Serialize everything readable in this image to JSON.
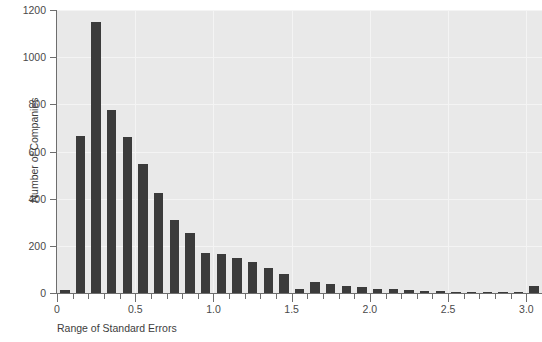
{
  "top_caption": "",
  "chart_data": {
    "type": "bar",
    "title": "",
    "xlabel": "Range of Standard Errors",
    "ylabel": "Number of Companies",
    "xlim": [
      0,
      3.1
    ],
    "ylim": [
      0,
      1200
    ],
    "grid": true,
    "legend": null,
    "bin_width": 0.1,
    "x_tick_labels": [
      "0",
      "0.5",
      "1.0",
      "1.5",
      "2.0",
      "2.5",
      "3.0"
    ],
    "x_tick_values": [
      0,
      0.5,
      1.0,
      1.5,
      2.0,
      2.5,
      3.0
    ],
    "x_minor_tick_step": 0.1,
    "y_tick_labels": [
      "0",
      "200",
      "400",
      "600",
      "800",
      "1000",
      "1200"
    ],
    "y_tick_values": [
      0,
      200,
      400,
      600,
      800,
      1000,
      1200
    ],
    "bar_color": "#3b3b3b",
    "plot_background": "#e9e9e9",
    "x": [
      0.05,
      0.15,
      0.25,
      0.35,
      0.45,
      0.55,
      0.65,
      0.75,
      0.85,
      0.95,
      1.05,
      1.15,
      1.25,
      1.35,
      1.45,
      1.55,
      1.65,
      1.75,
      1.85,
      1.95,
      2.05,
      2.15,
      2.25,
      2.35,
      2.45,
      2.55,
      2.65,
      2.75,
      2.85,
      2.95,
      3.05
    ],
    "categories": [
      "0.0-0.1",
      "0.1-0.2",
      "0.2-0.3",
      "0.3-0.4",
      "0.4-0.5",
      "0.5-0.6",
      "0.6-0.7",
      "0.7-0.8",
      "0.8-0.9",
      "0.9-1.0",
      "1.0-1.1",
      "1.1-1.2",
      "1.2-1.3",
      "1.3-1.4",
      "1.4-1.5",
      "1.5-1.6",
      "1.6-1.7",
      "1.7-1.8",
      "1.8-1.9",
      "1.9-2.0",
      "2.0-2.1",
      "2.1-2.2",
      "2.2-2.3",
      "2.3-2.4",
      "2.4-2.5",
      "2.5-2.6",
      "2.6-2.7",
      "2.7-2.8",
      "2.8-2.9",
      "2.9-3.0",
      "3.0-3.1"
    ],
    "values": [
      12,
      665,
      1150,
      775,
      660,
      545,
      425,
      310,
      255,
      170,
      165,
      150,
      130,
      105,
      80,
      18,
      45,
      40,
      30,
      25,
      18,
      15,
      12,
      10,
      8,
      5,
      6,
      5,
      4,
      3,
      28
    ],
    "ylabel_text": "Number of Companies",
    "xlabel_text": "Range of Standard Errors"
  }
}
